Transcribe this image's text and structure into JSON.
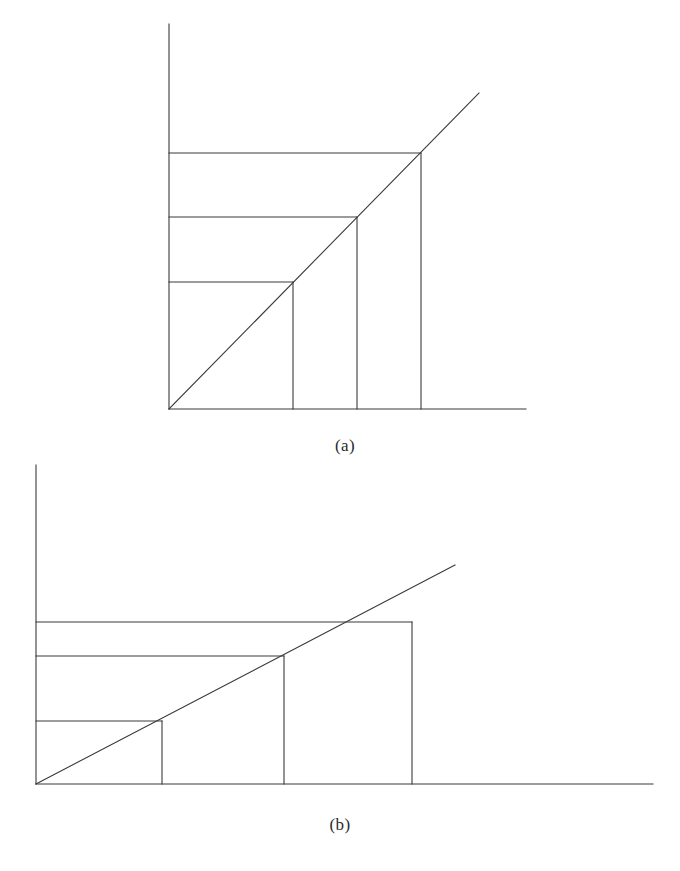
{
  "figure": {
    "background_color": "#ffffff",
    "stroke_color": "#3a3a3a",
    "stroke_width": 1.1,
    "caption_color": "#2b2b2b"
  },
  "panels": [
    {
      "id": "panel-a",
      "caption": "(a)",
      "caption_x": 345,
      "caption_y": 447,
      "axes": {
        "origin": {
          "x": 169,
          "y": 409
        },
        "y_axis_top": {
          "x": 169,
          "y": 24
        },
        "x_axis_right": {
          "x": 526,
          "y": 409
        }
      },
      "diagonal": {
        "from": {
          "x": 169,
          "y": 409
        },
        "to": {
          "x": 479,
          "y": 93
        },
        "slope_description": "rising 45 degrees through all rectangle top-right corners"
      },
      "rectangles": [
        {
          "left": 169,
          "right": 293,
          "top": 282,
          "bottom": 409
        },
        {
          "left": 169,
          "right": 357,
          "top": 217,
          "bottom": 409
        },
        {
          "left": 169,
          "right": 421,
          "top": 153,
          "bottom": 409
        }
      ],
      "horizontal_lines": [
        {
          "x1": 169,
          "y1": 282,
          "x2": 293,
          "y2": 282
        },
        {
          "x1": 169,
          "y1": 217,
          "x2": 357,
          "y2": 217
        },
        {
          "x1": 169,
          "y1": 153,
          "x2": 421,
          "y2": 153
        }
      ],
      "vertical_lines": [
        {
          "x1": 293,
          "y1": 282,
          "x2": 293,
          "y2": 409
        },
        {
          "x1": 357,
          "y1": 217,
          "x2": 357,
          "y2": 409
        },
        {
          "x1": 421,
          "y1": 153,
          "x2": 421,
          "y2": 409
        }
      ]
    },
    {
      "id": "panel-b",
      "caption": "(b)",
      "caption_x": 340,
      "caption_y": 826,
      "axes": {
        "origin": {
          "x": 36,
          "y": 784
        },
        "y_axis_top": {
          "x": 36,
          "y": 465
        },
        "x_axis_right": {
          "x": 653,
          "y": 784
        }
      },
      "diagonal": {
        "from": {
          "x": 36,
          "y": 784
        },
        "to": {
          "x": 455,
          "y": 565
        },
        "slope_description": "rising shallow line crossing the third rectangle top edge"
      },
      "rectangles": [
        {
          "left": 36,
          "right": 162,
          "top": 721,
          "bottom": 784
        },
        {
          "left": 36,
          "right": 284,
          "top": 656,
          "bottom": 784
        },
        {
          "left": 36,
          "right": 412,
          "top": 622,
          "bottom": 784
        }
      ],
      "horizontal_lines": [
        {
          "x1": 36,
          "y1": 721,
          "x2": 162,
          "y2": 721
        },
        {
          "x1": 36,
          "y1": 656,
          "x2": 284,
          "y2": 656
        },
        {
          "x1": 36,
          "y1": 622,
          "x2": 412,
          "y2": 622
        }
      ],
      "vertical_lines": [
        {
          "x1": 162,
          "y1": 721,
          "x2": 162,
          "y2": 784
        },
        {
          "x1": 284,
          "y1": 656,
          "x2": 284,
          "y2": 784
        },
        {
          "x1": 412,
          "y1": 622,
          "x2": 412,
          "y2": 784
        }
      ]
    }
  ]
}
